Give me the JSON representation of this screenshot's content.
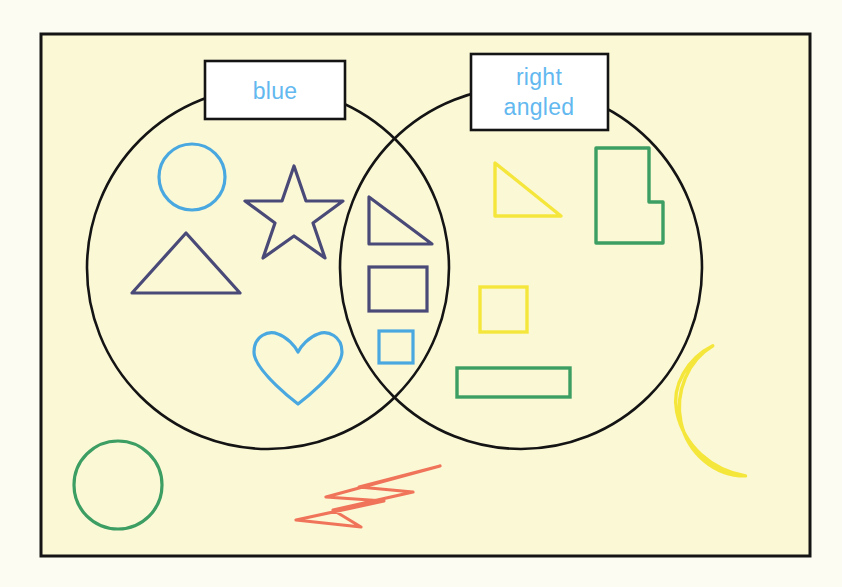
{
  "page": {
    "background_color": "#fdfcf2",
    "panel_color": "#fbf8d6",
    "frame_color": "#1a1a1a"
  },
  "diagram": {
    "type": "venn-2-set",
    "set_left": {
      "label": "blue",
      "label_color": "#62b8ef",
      "circle_color": "#141414",
      "center": [
        268,
        268
      ],
      "radius": 181
    },
    "set_right": {
      "label_line1": "right",
      "label_line2": "angled",
      "label_color": "#62b8ef",
      "circle_color": "#141414",
      "center": [
        521,
        268
      ],
      "radius": 181
    }
  },
  "shapes": {
    "left_only": [
      {
        "name": "circle",
        "color": "#49a8e0",
        "region": "blue-only"
      },
      {
        "name": "star",
        "color": "#4a4a78",
        "region": "blue-only"
      },
      {
        "name": "triangle",
        "color": "#4a4a78",
        "region": "blue-only"
      },
      {
        "name": "heart",
        "color": "#49a8e0",
        "region": "blue-only"
      }
    ],
    "intersection": [
      {
        "name": "right-triangle",
        "color": "#4a4a78",
        "region": "both"
      },
      {
        "name": "rectangle",
        "color": "#4a4a78",
        "region": "both"
      },
      {
        "name": "square",
        "color": "#49a8e0",
        "region": "both"
      }
    ],
    "right_only": [
      {
        "name": "right-triangle",
        "color": "#f5e63c",
        "region": "right-angled-only"
      },
      {
        "name": "l-shape",
        "color": "#3c9e63",
        "region": "right-angled-only"
      },
      {
        "name": "square",
        "color": "#f5e63c",
        "region": "right-angled-only"
      },
      {
        "name": "rectangle",
        "color": "#3c9e63",
        "region": "right-angled-only"
      }
    ],
    "outside": [
      {
        "name": "circle",
        "color": "#3c9e63",
        "region": "outside"
      },
      {
        "name": "lightning-bolt",
        "color": "#f0745a",
        "region": "outside"
      },
      {
        "name": "crescent-moon",
        "color": "#f5e63c",
        "region": "outside"
      }
    ]
  }
}
